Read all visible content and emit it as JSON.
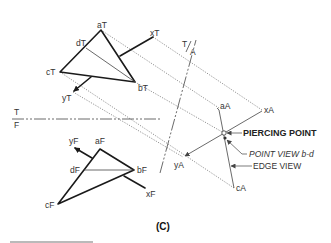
{
  "figure": {
    "caption": "(C)",
    "top_view": {
      "points": {
        "aT": {
          "label": "aT",
          "x": 101,
          "y": 30
        },
        "bT": {
          "label": "bT",
          "x": 135,
          "y": 82
        },
        "cT": {
          "label": "cT",
          "x": 60,
          "y": 72
        },
        "dT": {
          "label": "dT",
          "x": 86,
          "y": 48
        },
        "xT": {
          "label": "xT",
          "x": 153,
          "y": 37
        },
        "yT": {
          "label": "yT",
          "x": 73,
          "y": 92
        }
      }
    },
    "front_view": {
      "points": {
        "aF": {
          "label": "aF",
          "x": 100,
          "y": 149
        },
        "bF": {
          "label": "bF",
          "x": 134,
          "y": 170
        },
        "cF": {
          "label": "cF",
          "x": 58,
          "y": 204
        },
        "dF": {
          "label": "dF",
          "x": 84,
          "y": 170
        },
        "xF": {
          "label": "xF",
          "x": 145,
          "y": 188
        },
        "yF": {
          "label": "yF",
          "x": 73,
          "y": 147
        }
      }
    },
    "auxiliary_view": {
      "points": {
        "aA": {
          "label": "aA",
          "x": 219,
          "y": 108
        },
        "cA": {
          "label": "cA",
          "x": 234,
          "y": 188
        },
        "xA": {
          "label": "xA",
          "x": 262,
          "y": 110
        },
        "yA": {
          "label": "yA",
          "x": 183,
          "y": 157
        }
      }
    },
    "fold_lines": {
      "tf": {
        "top_label": "T",
        "bottom_label": "F"
      },
      "ta": {
        "top_label": "T",
        "bottom_label": "A"
      }
    },
    "annotations": {
      "piercing_point": "PIERCING POINT",
      "point_view": "POINT VIEW b-d",
      "edge_view": "EDGE VIEW"
    }
  }
}
